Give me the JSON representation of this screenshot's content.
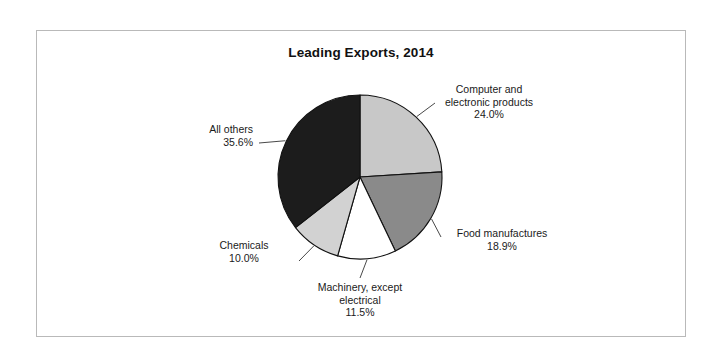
{
  "figure": {
    "background_color": "#ffffff",
    "frame_color": "#b9b9b9"
  },
  "chart_data": {
    "type": "pie",
    "title": "Leading Exports, 2014",
    "xlabel": "",
    "ylabel": "",
    "units": "percent",
    "start_angle_deg": 0,
    "direction": "clockwise",
    "legend": "none",
    "grid": false,
    "categories": [
      "Computer and electronic products",
      "Food manufactures",
      "Machinery, except electrical",
      "Chemicals",
      "All others"
    ],
    "values": [
      24.0,
      18.9,
      11.5,
      10.0,
      35.6
    ],
    "value_labels": [
      "24.0%",
      "18.9%",
      "11.5%",
      "10.0%",
      "35.6%"
    ],
    "colors": [
      "#c8c8c8",
      "#8a8a8a",
      "#ffffff",
      "#d2d2d2",
      "#1c1c1c"
    ],
    "slices": [
      {
        "name": "Computer and electronic products",
        "label_line1": "Computer and",
        "label_line2": "electronic products",
        "value": 24.0,
        "value_label": "24.0%",
        "color": "#c8c8c8"
      },
      {
        "name": "Food manufactures",
        "label_line1": "Food manufactures",
        "label_line2": "",
        "value": 18.9,
        "value_label": "18.9%",
        "color": "#8a8a8a"
      },
      {
        "name": "Machinery, except electrical",
        "label_line1": "Machinery, except",
        "label_line2": "electrical",
        "value": 11.5,
        "value_label": "11.5%",
        "color": "#ffffff"
      },
      {
        "name": "Chemicals",
        "label_line1": "Chemicals",
        "label_line2": "",
        "value": 10.0,
        "value_label": "10.0%",
        "color": "#d2d2d2"
      },
      {
        "name": "All others",
        "label_line1": "All others",
        "label_line2": "",
        "value": 35.6,
        "value_label": "35.6%",
        "color": "#1c1c1c"
      }
    ]
  }
}
